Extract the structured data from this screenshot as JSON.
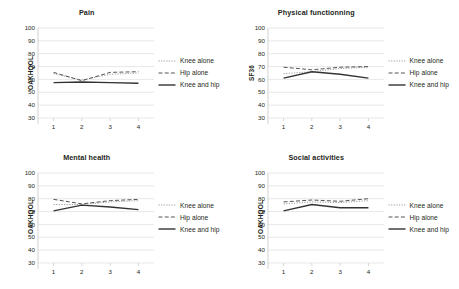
{
  "figure": {
    "background": "#ffffff",
    "series_colors": {
      "knee_alone": "#8c8c8c",
      "hip_alone": "#4d4d4d",
      "knee_and_hip": "#333333"
    },
    "axis_color": "#bfbfbf",
    "grid_color": "#d9d9d9",
    "text_color": "#231f20"
  },
  "legend": {
    "position": "right",
    "entries": [
      {
        "label": "Knee alone",
        "style": "dotted",
        "key": "knee_alone"
      },
      {
        "label": "Hip alone",
        "style": "dashed",
        "key": "hip_alone"
      },
      {
        "label": "Knee and hip",
        "style": "solid",
        "key": "knee_and_hip"
      }
    ]
  },
  "chart_data": [
    {
      "id": "pain",
      "type": "line",
      "title": "Pain",
      "xlabel": "",
      "ylabel": "OAKHQOL",
      "x": [
        1,
        2,
        3,
        4
      ],
      "xticklabels": [
        "1",
        "2",
        "3",
        "4"
      ],
      "ylim": [
        30,
        100
      ],
      "yticks": [
        30,
        40,
        50,
        60,
        70,
        80,
        90,
        100
      ],
      "yticklabels": [
        "30",
        "40",
        "50",
        "60",
        "70",
        "80",
        "90",
        "100"
      ],
      "grid": true,
      "series": [
        {
          "name": "Knee alone",
          "values": [
            64.5,
            59.5,
            64.0,
            65.0
          ]
        },
        {
          "name": "Hip alone",
          "values": [
            65.5,
            59.0,
            65.5,
            66.0
          ]
        },
        {
          "name": "Knee and hip",
          "values": [
            57.5,
            58.0,
            57.5,
            57.0
          ]
        }
      ]
    },
    {
      "id": "physical-functionning",
      "type": "line",
      "title": "Physical functionning",
      "xlabel": "",
      "ylabel": "SF36",
      "x": [
        1,
        2,
        3,
        4
      ],
      "xticklabels": [
        "1",
        "2",
        "3",
        "4"
      ],
      "ylim": [
        30,
        100
      ],
      "yticks": [
        30,
        40,
        50,
        60,
        70,
        80,
        90,
        100
      ],
      "yticklabels": [
        "30",
        "40",
        "50",
        "60",
        "70",
        "80",
        "90",
        "100"
      ],
      "grid": true,
      "series": [
        {
          "name": "Knee alone",
          "values": [
            64.5,
            66.0,
            68.5,
            69.5
          ]
        },
        {
          "name": "Hip alone",
          "values": [
            69.5,
            67.5,
            69.5,
            70.0
          ]
        },
        {
          "name": "Knee and hip",
          "values": [
            61.0,
            66.0,
            64.0,
            61.0
          ]
        }
      ]
    },
    {
      "id": "mental-health",
      "type": "line",
      "title": "Mental health",
      "xlabel": "",
      "ylabel": "OAKHQOL",
      "x": [
        1,
        2,
        3,
        4
      ],
      "xticklabels": [
        "1",
        "2",
        "3",
        "4"
      ],
      "ylim": [
        30,
        100
      ],
      "yticks": [
        30,
        40,
        50,
        60,
        70,
        80,
        90,
        100
      ],
      "yticklabels": [
        "30",
        "40",
        "50",
        "60",
        "70",
        "80",
        "90",
        "100"
      ],
      "grid": true,
      "series": [
        {
          "name": "Knee alone",
          "values": [
            75.5,
            75.5,
            77.5,
            78.5
          ]
        },
        {
          "name": "Hip alone",
          "values": [
            79.5,
            76.0,
            78.5,
            79.5
          ]
        },
        {
          "name": "Knee and hip",
          "values": [
            70.5,
            75.0,
            73.5,
            71.5
          ]
        }
      ]
    },
    {
      "id": "social-activities",
      "type": "line",
      "title": "Social activities",
      "xlabel": "",
      "ylabel": "OAKHQOL",
      "x": [
        1,
        2,
        3,
        4
      ],
      "xticklabels": [
        "1",
        "2",
        "3",
        "4"
      ],
      "ylim": [
        30,
        100
      ],
      "yticks": [
        30,
        40,
        50,
        60,
        70,
        80,
        90,
        100
      ],
      "yticklabels": [
        "30",
        "40",
        "50",
        "60",
        "70",
        "80",
        "90",
        "100"
      ],
      "grid": true,
      "series": [
        {
          "name": "Knee alone",
          "values": [
            76.0,
            77.5,
            77.0,
            78.5
          ]
        },
        {
          "name": "Hip alone",
          "values": [
            77.5,
            79.0,
            78.0,
            80.0
          ]
        },
        {
          "name": "Knee and hip",
          "values": [
            70.5,
            75.5,
            73.0,
            73.0
          ]
        }
      ]
    }
  ]
}
